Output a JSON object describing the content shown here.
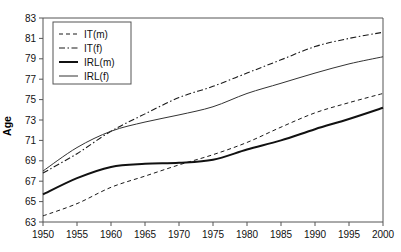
{
  "chart_data": {
    "type": "line",
    "title": "",
    "subtitle": "",
    "xlabel": "",
    "ylabel": "Age",
    "xlim": [
      1950,
      2000
    ],
    "ylim": [
      63,
      83
    ],
    "grid": false,
    "legend_position": "top-left",
    "xticks": [
      1950,
      1955,
      1960,
      1965,
      1970,
      1975,
      1980,
      1985,
      1990,
      1995,
      2000
    ],
    "yticks": [
      63,
      65,
      67,
      69,
      71,
      73,
      75,
      77,
      79,
      81,
      83
    ],
    "x": [
      1950,
      1955,
      1960,
      1965,
      1970,
      1975,
      1980,
      1985,
      1990,
      1995,
      2000
    ],
    "series": [
      {
        "name": "IT(m)",
        "style": "dashed",
        "color": "#1a1a1a",
        "width": 1.0,
        "values": [
          63.6,
          64.8,
          66.4,
          67.5,
          68.6,
          69.6,
          70.8,
          72.3,
          73.7,
          74.7,
          75.6
        ]
      },
      {
        "name": "IT(f)",
        "style": "dash-dot",
        "color": "#1a1a1a",
        "width": 1.1,
        "values": [
          67.8,
          69.7,
          71.9,
          73.6,
          75.2,
          76.3,
          77.6,
          78.9,
          80.2,
          81.0,
          81.6
        ]
      },
      {
        "name": "IRL(m)",
        "style": "solid-thick",
        "color": "#111111",
        "width": 2.0,
        "values": [
          65.7,
          67.3,
          68.4,
          68.7,
          68.8,
          69.1,
          70.1,
          71.0,
          72.1,
          73.1,
          74.2
        ]
      },
      {
        "name": "IRL(f)",
        "style": "solid-thin",
        "color": "#333333",
        "width": 1.0,
        "values": [
          68.0,
          70.3,
          71.9,
          72.8,
          73.5,
          74.3,
          75.6,
          76.6,
          77.6,
          78.5,
          79.2
        ]
      }
    ]
  },
  "axes": {
    "y_axis_label": "Age"
  },
  "legend": {
    "entries": [
      {
        "label": "IT(m)"
      },
      {
        "label": "IT(f)"
      },
      {
        "label": "IRL(m)"
      },
      {
        "label": "IRL(f)"
      }
    ]
  }
}
